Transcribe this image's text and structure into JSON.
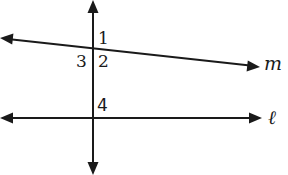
{
  "diagram": {
    "type": "parallel-lines-transversal",
    "lines": [
      {
        "id": "transversal",
        "label": "",
        "x1": 93,
        "y1": 8,
        "x2": 93,
        "y2": 167
      },
      {
        "id": "m",
        "label": "m",
        "x1": 8,
        "y1": 39,
        "x2": 252,
        "y2": 66
      },
      {
        "id": "l",
        "label": "ℓ",
        "x1": 8,
        "y1": 118,
        "x2": 254,
        "y2": 118
      }
    ],
    "angle_labels": [
      {
        "id": "angle-1",
        "text": "1"
      },
      {
        "id": "angle-2",
        "text": "2"
      },
      {
        "id": "angle-3",
        "text": "3"
      },
      {
        "id": "angle-4",
        "text": "4"
      }
    ],
    "line_labels": {
      "m": "m",
      "l": "ℓ"
    },
    "colors": {
      "stroke": "#1a1a1a",
      "background": "#ffffff"
    }
  }
}
